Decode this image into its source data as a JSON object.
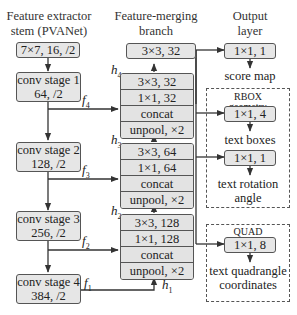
{
  "headers": {
    "extractor": [
      "Feature extractor",
      "stem (PVANet)"
    ],
    "merging": [
      "Feature-merging",
      "branch"
    ],
    "output": [
      "Output",
      "layer"
    ]
  },
  "extractor": {
    "stem": "7×7, 16, /2",
    "stages": [
      {
        "name": "conv stage 1",
        "params": "64, /2"
      },
      {
        "name": "conv stage 2",
        "params": "128, /2"
      },
      {
        "name": "conv stage 3",
        "params": "256, /2"
      },
      {
        "name": "conv stage 4",
        "params": "384, /2"
      }
    ]
  },
  "merging": {
    "top": "3×3, 32",
    "blocks": [
      {
        "h": "h",
        "h_sub": "4",
        "cells": [
          "3×3, 32",
          "1×1, 32",
          "concat",
          "unpool, ×2"
        ]
      },
      {
        "h": "h",
        "h_sub": "3",
        "cells": [
          "3×3, 64",
          "1×1, 64",
          "concat",
          "unpool, ×2"
        ]
      },
      {
        "h": "h",
        "h_sub": "2",
        "cells": [
          "3×3, 128",
          "1×1, 128",
          "concat",
          "unpool, ×2"
        ]
      }
    ],
    "h1": {
      "h": "h",
      "h_sub": "1"
    }
  },
  "features": [
    {
      "f": "f",
      "f_sub": "4"
    },
    {
      "f": "f",
      "f_sub": "3"
    },
    {
      "f": "f",
      "f_sub": "2"
    },
    {
      "f": "f",
      "f_sub": "1"
    }
  ],
  "output": {
    "score": {
      "conv": "1×1, 1",
      "label": "score map"
    },
    "rbox": {
      "title": "RBOX",
      "subtitle": "geometry",
      "boxes_conv": "1×1, 4",
      "boxes_label": "text boxes",
      "angle_conv": "1×1, 1",
      "angle_label_1": "text rotation",
      "angle_label_2": "angle"
    },
    "quad": {
      "title": "QUAD",
      "subtitle": "geometry",
      "conv": "1×1, 8",
      "label_1": "text quadrangle",
      "label_2": "coordinates"
    }
  },
  "colors": {
    "box_fill": "#e6e6e6",
    "stroke": "#555555",
    "text": "#222222"
  }
}
